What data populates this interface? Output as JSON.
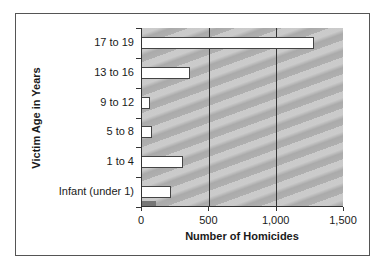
{
  "chart_data": {
    "type": "bar",
    "orientation": "horizontal",
    "title": "",
    "xlabel": "Number of Homicides",
    "ylabel": "Victim Age in Years",
    "categories": [
      "17 to 19",
      "13 to 16",
      "9 to 12",
      "5 to 8",
      "1 to 4",
      "Infant (under 1)"
    ],
    "values": [
      1280,
      358,
      62,
      75,
      304,
      219
    ],
    "xlim": [
      0,
      1500
    ],
    "xticks": [
      "0",
      "500",
      "1,000",
      "1,500"
    ],
    "grid": true,
    "legend": null,
    "colors": {
      "bar_fill": "#ffffff",
      "plot_background": "#b9b9b9",
      "gridline": "#333333"
    }
  }
}
